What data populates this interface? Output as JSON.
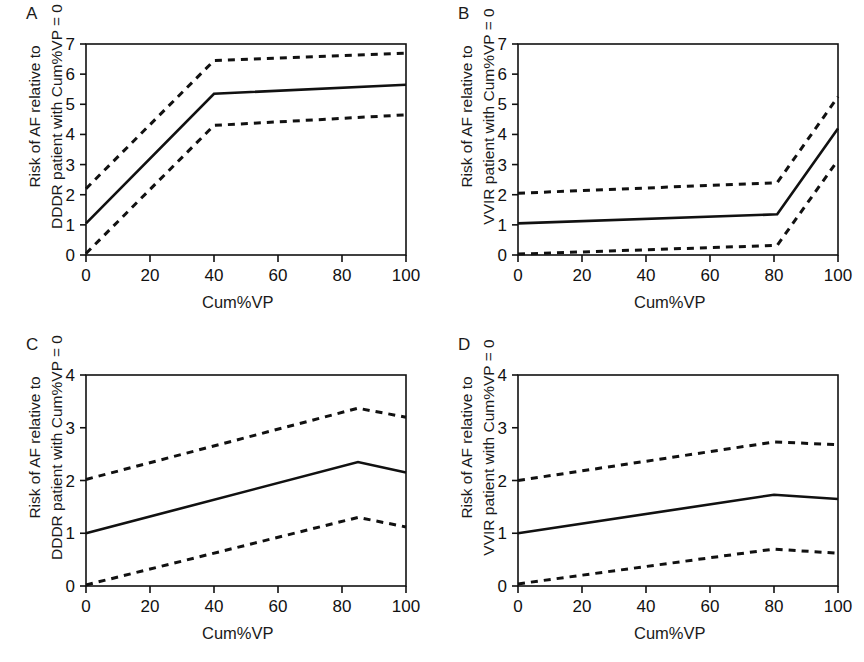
{
  "figure": {
    "panel_count": 4,
    "background": "#ffffff",
    "line_color": "#111111"
  },
  "panels": [
    {
      "letter": "A",
      "ylabel_line1": "Risk of AF relative to",
      "ylabel_line2": "DDDR patient with Cum%VP = 0",
      "xlabel": "Cum%VP",
      "chart_data": {
        "type": "line",
        "title": "A",
        "xlabel": "Cum%VP",
        "ylabel": "Risk of AF relative to DDDR patient with Cum%VP = 0",
        "xlim": [
          0,
          100
        ],
        "ylim": [
          0,
          7
        ],
        "xticks": [
          0,
          20,
          40,
          60,
          80,
          100
        ],
        "yticks": [
          0,
          1,
          2,
          3,
          4,
          5,
          6,
          7
        ],
        "grid": false,
        "legend": "none",
        "series": [
          {
            "name": "Estimate",
            "style": "solid",
            "x": [
              0,
              40,
              100
            ],
            "values": [
              1.05,
              5.35,
              5.65
            ]
          },
          {
            "name": "Upper 95% CI",
            "style": "dashed",
            "x": [
              0,
              40,
              100
            ],
            "values": [
              2.2,
              6.45,
              6.7
            ]
          },
          {
            "name": "Lower 95% CI",
            "style": "dashed",
            "x": [
              0,
              40,
              100
            ],
            "values": [
              0.05,
              4.3,
              4.65
            ]
          }
        ]
      }
    },
    {
      "letter": "B",
      "ylabel_line1": "Risk of AF relative to",
      "ylabel_line2": "VVIR patient with Cum%VP = 0",
      "xlabel": "Cum%VP",
      "chart_data": {
        "type": "line",
        "title": "B",
        "xlabel": "Cum%VP",
        "ylabel": "Risk of AF relative to VVIR patient with Cum%VP = 0",
        "xlim": [
          0,
          100
        ],
        "ylim": [
          0,
          7
        ],
        "xticks": [
          0,
          20,
          40,
          60,
          80,
          100
        ],
        "yticks": [
          0,
          1,
          2,
          3,
          4,
          5,
          6,
          7
        ],
        "grid": false,
        "legend": "none",
        "series": [
          {
            "name": "Estimate",
            "style": "solid",
            "x": [
              0,
              81,
              100
            ],
            "values": [
              1.05,
              1.35,
              4.2
            ]
          },
          {
            "name": "Upper 95% CI",
            "style": "dashed",
            "x": [
              0,
              81,
              100
            ],
            "values": [
              2.05,
              2.4,
              5.25
            ]
          },
          {
            "name": "Lower 95% CI",
            "style": "dashed",
            "x": [
              0,
              81,
              100
            ],
            "values": [
              0.03,
              0.32,
              3.15
            ]
          }
        ]
      }
    },
    {
      "letter": "C",
      "ylabel_line1": "Risk of AF relative to",
      "ylabel_line2": "DDDR patient with Cum%VP = 0",
      "xlabel": "Cum%VP",
      "chart_data": {
        "type": "line",
        "title": "C",
        "xlabel": "Cum%VP",
        "ylabel": "Risk of AF relative to DDDR patient with Cum%VP = 0",
        "xlim": [
          0,
          100
        ],
        "ylim": [
          0,
          4
        ],
        "xticks": [
          0,
          20,
          40,
          60,
          80,
          100
        ],
        "yticks": [
          0,
          1,
          2,
          3,
          4
        ],
        "grid": false,
        "legend": "none",
        "series": [
          {
            "name": "Estimate",
            "style": "solid",
            "x": [
              0,
              85,
              100
            ],
            "values": [
              1.0,
              2.35,
              2.15
            ]
          },
          {
            "name": "Upper 95% CI",
            "style": "dashed",
            "x": [
              0,
              85,
              100
            ],
            "values": [
              2.02,
              3.37,
              3.2
            ]
          },
          {
            "name": "Lower 95% CI",
            "style": "dashed",
            "x": [
              0,
              85,
              100
            ],
            "values": [
              0.02,
              1.3,
              1.12
            ]
          }
        ]
      }
    },
    {
      "letter": "D",
      "ylabel_line1": "Risk of AF relative to",
      "ylabel_line2": "VVIR patient with Cum%VP = 0",
      "xlabel": "Cum%VP",
      "chart_data": {
        "type": "line",
        "title": "D",
        "xlabel": "Cum%VP",
        "ylabel": "Risk of AF relative to VVIR patient with Cum%VP = 0",
        "xlim": [
          0,
          100
        ],
        "ylim": [
          0,
          4
        ],
        "xticks": [
          0,
          20,
          40,
          60,
          80,
          100
        ],
        "yticks": [
          0,
          1,
          2,
          3,
          4
        ],
        "grid": false,
        "legend": "none",
        "series": [
          {
            "name": "Estimate",
            "style": "solid",
            "x": [
              0,
              80,
              100
            ],
            "values": [
              1.0,
              1.73,
              1.65
            ]
          },
          {
            "name": "Upper 95% CI",
            "style": "dashed",
            "x": [
              0,
              80,
              100
            ],
            "values": [
              2.0,
              2.73,
              2.68
            ]
          },
          {
            "name": "Lower 95% CI",
            "style": "dashed",
            "x": [
              0,
              80,
              100
            ],
            "values": [
              0.04,
              0.7,
              0.62
            ]
          }
        ]
      }
    }
  ]
}
